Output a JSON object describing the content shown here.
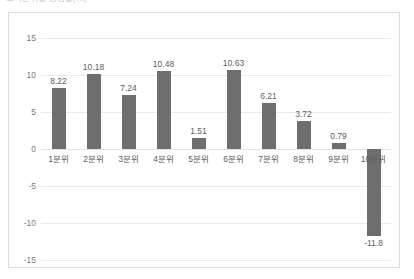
{
  "chart_title_sliver": "소득분위별 증감률(%)",
  "chart_data": {
    "type": "bar",
    "title": "",
    "xlabel": "",
    "ylabel": "",
    "categories": [
      "1분위",
      "2분위",
      "3분위",
      "4분위",
      "5분위",
      "6분위",
      "7분위",
      "8분위",
      "9분위",
      "10분위"
    ],
    "values": [
      8.22,
      10.18,
      7.24,
      10.48,
      1.51,
      10.63,
      6.21,
      3.72,
      0.79,
      -11.8
    ],
    "value_labels": [
      "8.22",
      "10.18",
      "7.24",
      "10.48",
      "1.51",
      "10.63",
      "6.21",
      "3.72",
      "0.79",
      "-11.8"
    ],
    "ylim": [
      -15,
      15
    ],
    "yticks": [
      15,
      10,
      5,
      0,
      -5,
      -10,
      -15
    ],
    "ytick_labels": [
      "15",
      "10",
      "5",
      "0",
      "-5",
      "-10",
      "-15"
    ],
    "grid": true,
    "legend": "none",
    "bar_color": "#6e6e6e",
    "gridline_color": "#e9e9e9",
    "frame_color": "#dcdcdc",
    "text_color": "#5d5d5d"
  }
}
